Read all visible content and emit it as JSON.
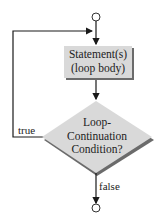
{
  "diagram": {
    "type": "flowchart",
    "nodes": {
      "start": {
        "shape": "circle"
      },
      "body": {
        "shape": "rectangle",
        "line1": "Statement(s)",
        "line2": "(loop body)"
      },
      "condition": {
        "shape": "diamond",
        "line1": "Loop-",
        "line2": "Continuation",
        "line3": "Condition?"
      },
      "end": {
        "shape": "circle"
      }
    },
    "edges": {
      "true_label": "true",
      "false_label": "false"
    },
    "colors": {
      "shape_fill": "#d9d9d9",
      "shape_shadow": "#6b6b6b",
      "line": "#1a1a1a"
    }
  }
}
